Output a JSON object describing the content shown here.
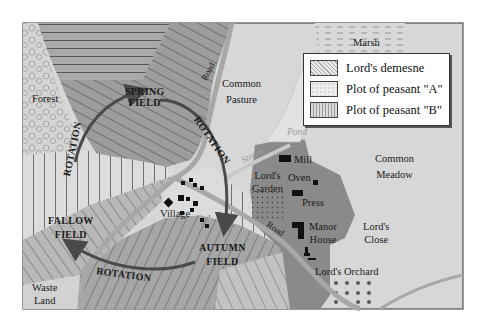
{
  "map": {
    "regions": {
      "forest": "Forest",
      "marsh": "Marsh",
      "common_pasture": [
        "Common",
        "Pasture"
      ],
      "common_meadow": [
        "Common",
        "Meadow"
      ],
      "waste_land": [
        "Waste",
        "Land"
      ],
      "pond": "Pond",
      "stream": "Stream",
      "road_top": "Road",
      "road_bottom": "Road"
    },
    "fields": {
      "spring": [
        "SPRING",
        "FIELD"
      ],
      "fallow": [
        "FALLOW",
        "FIELD"
      ],
      "autumn": [
        "AUTUMN",
        "FIELD"
      ]
    },
    "rotation_labels": [
      "ROTATION",
      "ROTATION",
      "ROTATION"
    ],
    "settlement": {
      "village": "Village",
      "mill": "Mill",
      "oven": "Oven",
      "press": "Press",
      "manor_house": [
        "Manor",
        "House"
      ],
      "lords_garden": [
        "Lord's",
        "Garden"
      ],
      "lords_close": [
        "Lord's",
        "Close"
      ],
      "lords_orchard": "Lord's Orchard"
    },
    "legend": {
      "items": [
        {
          "label": "Lord's demesne",
          "pattern": "diagonal-hatch"
        },
        {
          "label": "Plot of peasant \"A\"",
          "pattern": "dotted-light"
        },
        {
          "label": "Plot of peasant \"B\"",
          "pattern": "vertical-lines"
        }
      ]
    },
    "colors": {
      "background": "#d7d7d7",
      "demesne_dark": "#8a8a8a",
      "strip_mid": "#b0b0b0",
      "strip_light": "#dedede",
      "road": "#a8a8a8",
      "arrow": "#4a4a4a",
      "building": "#111111"
    }
  }
}
